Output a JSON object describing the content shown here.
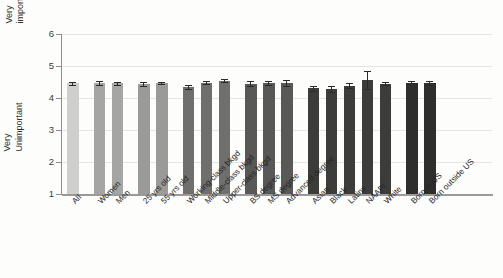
{
  "chart_data": {
    "type": "bar",
    "title": "",
    "xlabel": "",
    "ylabel": "",
    "ylim": [
      1,
      6
    ],
    "y_tick_labels": [
      "1",
      "2",
      "3",
      "4",
      "5",
      "6"
    ],
    "y_axis_top_label": "Very important",
    "y_axis_top_label_line1": "Very",
    "y_axis_top_label_line2": "important",
    "y_axis_bottom_label": "Very Unimportant",
    "y_axis_bottom_label_line1": "Very",
    "y_axis_bottom_label_line2": "Unimportant",
    "grid": true,
    "legend": "none",
    "error_bars": "standard error",
    "categories": [
      "All",
      "Women",
      "Men",
      "25 yrs old",
      "55 yrs old",
      "Working-class bkgd",
      "Middle-class bkgd",
      "Upper-class bkgd",
      "BS degree",
      "MS degree",
      "Advanced degree",
      "Asian",
      "Black",
      "Latinx",
      "NAAPI",
      "White",
      "Born in US",
      "Born outside US"
    ],
    "values": [
      4.46,
      4.47,
      4.46,
      4.44,
      4.47,
      4.34,
      4.48,
      4.54,
      4.45,
      4.46,
      4.48,
      4.3,
      4.29,
      4.39,
      4.56,
      4.45,
      4.48,
      4.47
    ],
    "errors": [
      0.04,
      0.05,
      0.05,
      0.05,
      0.04,
      0.06,
      0.05,
      0.05,
      0.07,
      0.06,
      0.09,
      0.08,
      0.09,
      0.09,
      0.27,
      0.04,
      0.04,
      0.07
    ],
    "groups": [
      {
        "name": "overall",
        "categories": [
          "All"
        ],
        "color": "#cfcfcd"
      },
      {
        "name": "gender",
        "categories": [
          "Women",
          "Men"
        ],
        "color": "#a5a5a3"
      },
      {
        "name": "age",
        "categories": [
          "25 yrs old",
          "55 yrs old"
        ],
        "color": "#9a9a98"
      },
      {
        "name": "class-background",
        "categories": [
          "Working-class bkgd",
          "Middle-class bkgd",
          "Upper-class bkgd"
        ],
        "color": "#6f6f6d"
      },
      {
        "name": "education",
        "categories": [
          "BS degree",
          "MS degree",
          "Advanced degree"
        ],
        "color": "#585856"
      },
      {
        "name": "race-ethnicity",
        "categories": [
          "Asian",
          "Black",
          "Latinx",
          "NAAPI",
          "White"
        ],
        "color": "#3c3c3a"
      },
      {
        "name": "nativity",
        "categories": [
          "Born in US",
          "Born outside US"
        ],
        "color": "#2e2e2c"
      }
    ]
  },
  "colors": {
    "background": "#fdfdfc",
    "gridline": "#e4e4e2",
    "axis": "#8d8d8d",
    "text": "#242424",
    "error_bar": "#2a2a2a"
  }
}
